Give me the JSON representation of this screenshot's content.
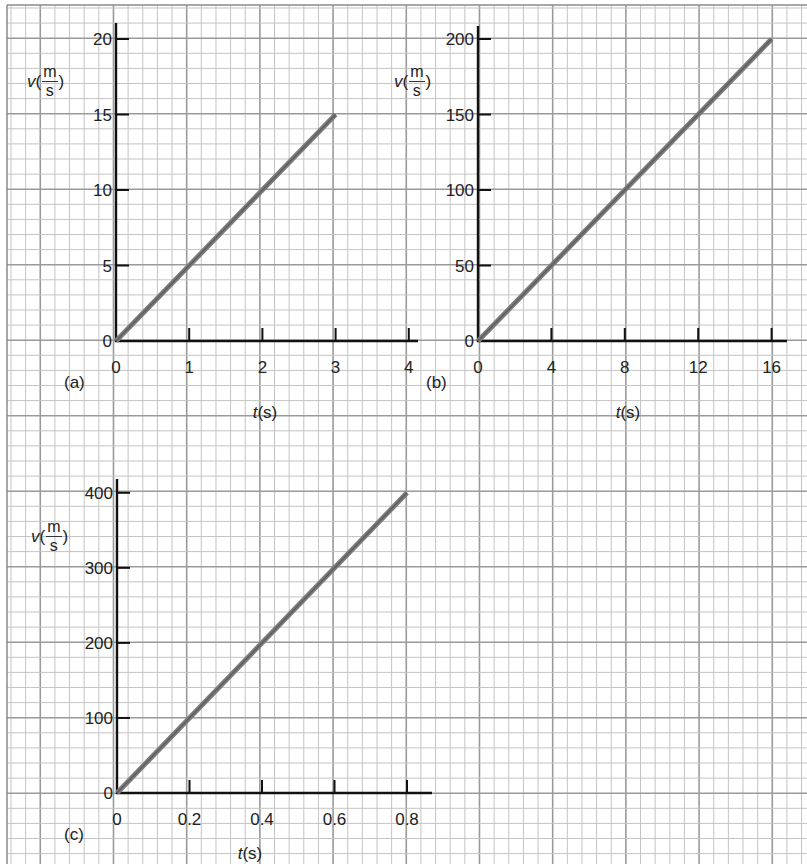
{
  "figure": {
    "grid": {
      "minor_color": "#c4c4c4",
      "major_color": "#9a9a9a",
      "border_color": "#8a8a8a",
      "x0": 11,
      "dx": 14.64,
      "x_major_offset": 2,
      "y0": 8,
      "dy": 15.1,
      "y_major_offset": 2,
      "major_every": 5
    },
    "line_color": "#7a7a7a",
    "axis_color": "#111111"
  },
  "chart_data": [
    {
      "panel": "(a)",
      "type": "line",
      "title": "",
      "xlabel": "t(s)",
      "xlabel_var": "t",
      "xlabel_unit": "(s)",
      "ylabel": "v(m/s)",
      "ylabel_var": "v",
      "ylabel_num": "m",
      "ylabel_den": "s",
      "x_ticks": [
        0,
        1,
        2,
        3,
        4
      ],
      "x_tick_labels": [
        "0",
        "1",
        "2",
        "3",
        "4"
      ],
      "y_ticks": [
        0,
        5,
        10,
        15,
        20
      ],
      "y_tick_labels": [
        "0",
        "5",
        "10",
        "15",
        "20"
      ],
      "xlim": [
        0,
        4.15
      ],
      "ylim": [
        0,
        21
      ],
      "grid": true,
      "series": [
        {
          "name": "v",
          "x": [
            0,
            3
          ],
          "y": [
            0,
            15
          ]
        }
      ],
      "layout": {
        "origin_px": [
          116,
          341
        ],
        "x_unit_px": 73.2,
        "y_unit_px": 15.1,
        "y_axis_top": 23,
        "x_axis_end": 418,
        "tag_pos": [
          64,
          382
        ],
        "xlabel_pos": [
          265,
          412
        ],
        "ylabel_pos": [
          27,
          78
        ]
      }
    },
    {
      "panel": "(b)",
      "type": "line",
      "title": "",
      "xlabel": "t(s)",
      "xlabel_var": "t",
      "xlabel_unit": "(s)",
      "ylabel": "v(m/s)",
      "ylabel_var": "v",
      "ylabel_num": "m",
      "ylabel_den": "s",
      "x_ticks": [
        0,
        4,
        8,
        12,
        16
      ],
      "x_tick_labels": [
        "0",
        "4",
        "8",
        "12",
        "16"
      ],
      "y_ticks": [
        0,
        50,
        100,
        150,
        200
      ],
      "y_tick_labels": [
        "0",
        "50",
        "100",
        "150",
        "200"
      ],
      "xlim": [
        0,
        16.8
      ],
      "ylim": [
        0,
        210
      ],
      "grid": true,
      "series": [
        {
          "name": "v",
          "x": [
            0,
            16
          ],
          "y": [
            0,
            200
          ]
        }
      ],
      "layout": {
        "origin_px": [
          478,
          341
        ],
        "x_unit_px": 18.35,
        "y_unit_px": 1.51,
        "y_axis_top": 26,
        "x_axis_end": 787,
        "tag_pos": [
          426,
          382
        ],
        "xlabel_pos": [
          628,
          412
        ],
        "ylabel_pos": [
          394,
          78
        ]
      }
    },
    {
      "panel": "(c)",
      "type": "line",
      "title": "",
      "xlabel": "t(s)",
      "xlabel_var": "t",
      "xlabel_unit": "(s)",
      "ylabel": "v(m/s)",
      "ylabel_var": "v",
      "ylabel_num": "m",
      "ylabel_den": "s",
      "x_ticks": [
        0,
        0.2,
        0.4,
        0.6,
        0.8
      ],
      "x_tick_labels": [
        "0",
        "0.2",
        "0.4",
        "0.6",
        "0.8"
      ],
      "y_ticks": [
        0,
        100,
        200,
        300,
        400
      ],
      "y_tick_labels": [
        "0",
        "100",
        "200",
        "300",
        "400"
      ],
      "xlim": [
        0,
        0.86
      ],
      "ylim": [
        0,
        420
      ],
      "grid": true,
      "series": [
        {
          "name": "v",
          "x": [
            0,
            0.8
          ],
          "y": [
            0,
            400
          ]
        }
      ],
      "layout": {
        "origin_px": [
          117,
          793
        ],
        "x_unit_px": 362.5,
        "y_unit_px": 0.7505,
        "y_axis_top": 479,
        "x_axis_end": 432,
        "tag_pos": [
          64,
          834
        ],
        "xlabel_pos": [
          250,
          853
        ],
        "ylabel_pos": [
          31,
          533
        ]
      }
    }
  ]
}
